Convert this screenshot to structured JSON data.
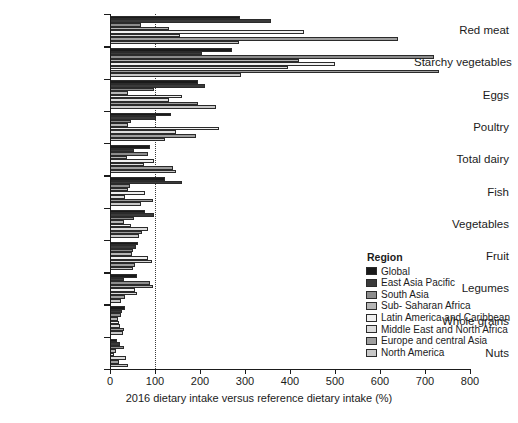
{
  "chart_data": {
    "type": "bar",
    "orientation": "horizontal",
    "title": "",
    "xlabel": "2016 dietary intake versus reference dietary intake (%)",
    "ylabel": "",
    "xlim": [
      0,
      800
    ],
    "xticks": [
      0,
      100,
      200,
      300,
      400,
      500,
      600,
      700,
      800
    ],
    "grid": false,
    "reference_line": 100,
    "legend_position": "right-inside",
    "legend_title": "Region",
    "categories": [
      "Red meat",
      "Starchy vegetables",
      "Eggs",
      "Poultry",
      "Total dairy",
      "Fish",
      "Vegetables",
      "Fruit",
      "Legumes",
      "Whole grains",
      "Nuts"
    ],
    "series": [
      {
        "name": "Global",
        "color": "#1a1a1a",
        "values": [
          288,
          272,
          196,
          135,
          89,
          122,
          77,
          63,
          60,
          34,
          15
        ]
      },
      {
        "name": "East Asia Pacific",
        "color": "#3a3a3a",
        "values": [
          358,
          205,
          212,
          103,
          53,
          160,
          97,
          58,
          31,
          27,
          23
        ]
      },
      {
        "name": "South Asia",
        "color": "#8c8c8c",
        "values": [
          68,
          720,
          98,
          47,
          84,
          44,
          54,
          52,
          88,
          24,
          31
        ]
      },
      {
        "name": "Sub- Saharan Africa",
        "color": "#b5b5b5",
        "values": [
          130,
          420,
          40,
          39,
          37,
          40,
          30,
          49,
          95,
          18,
          14
        ]
      },
      {
        "name": "Latin America and Caribbean",
        "color": "#f0f0f0",
        "values": [
          432,
          500,
          160,
          242,
          97,
          78,
          47,
          84,
          55,
          20,
          9
        ]
      },
      {
        "name": "Middle East and North Africa",
        "color": "#dcdcdc",
        "values": [
          155,
          395,
          132,
          146,
          76,
          34,
          85,
          93,
          60,
          23,
          36
        ]
      },
      {
        "name": "Europe and central Asia",
        "color": "#9e9e9e",
        "values": [
          640,
          730,
          195,
          190,
          140,
          95,
          72,
          55,
          33,
          30,
          21
        ]
      },
      {
        "name": "North America",
        "color": "#c8c8c8",
        "values": [
          287,
          290,
          235,
          123,
          147,
          68,
          65,
          52,
          25,
          29,
          39
        ]
      }
    ]
  },
  "axis": {
    "x_title": "2016 dietary intake versus reference dietary intake (%)"
  },
  "legend": {
    "title": "Region"
  }
}
